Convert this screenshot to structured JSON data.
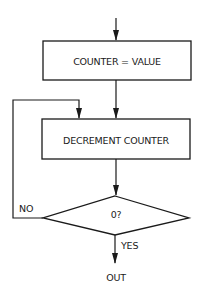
{
  "diagram": {
    "type": "flowchart",
    "colors": {
      "stroke": "#1a1a1a",
      "background": "#ffffff"
    },
    "nodes": [
      {
        "id": "set_counter",
        "shape": "process",
        "label": "COUNTER = VALUE"
      },
      {
        "id": "decrement",
        "shape": "process",
        "label": "DECREMENT COUNTER"
      },
      {
        "id": "zero_check",
        "shape": "decision",
        "label": "0?"
      },
      {
        "id": "exit",
        "shape": "terminal-label",
        "label": "OUT"
      }
    ],
    "edges": [
      {
        "from": "entry",
        "to": "set_counter",
        "label": ""
      },
      {
        "from": "set_counter",
        "to": "decrement",
        "label": ""
      },
      {
        "from": "decrement",
        "to": "zero_check",
        "label": ""
      },
      {
        "from": "zero_check",
        "to": "decrement",
        "label": "NO"
      },
      {
        "from": "zero_check",
        "to": "exit",
        "label": "YES"
      }
    ]
  },
  "labels": {
    "box1": "COUNTER = VALUE",
    "box2": "DECREMENT COUNTER",
    "decision": "0?",
    "no": "NO",
    "yes": "YES",
    "out": "OUT"
  }
}
